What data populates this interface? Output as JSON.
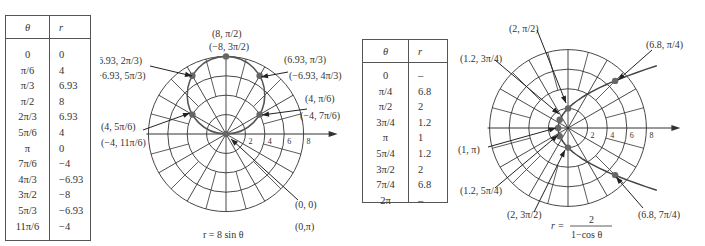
{
  "table1": {
    "headers": [
      "θ",
      "r"
    ],
    "rows": [
      [
        "0",
        "0"
      ],
      [
        "π/6",
        "4"
      ],
      [
        "π/3",
        "6.93"
      ],
      [
        "π/2",
        "8"
      ],
      [
        "2π/3",
        "6.93"
      ],
      [
        "5π/6",
        "4"
      ],
      [
        "π",
        "0"
      ],
      [
        "7π/6",
        "−4"
      ],
      [
        "4π/3",
        "−6.93"
      ],
      [
        "3π/2",
        "−8"
      ],
      [
        "5π/3",
        "−6.93"
      ],
      [
        "11π/6",
        "−4"
      ]
    ]
  },
  "table2": {
    "headers": [
      "θ",
      "r"
    ],
    "rows": [
      [
        "0",
        "–"
      ],
      [
        "π/4",
        "6.8"
      ],
      [
        "π/2",
        "2"
      ],
      [
        "3π/4",
        "1.2"
      ],
      [
        "π",
        "1"
      ],
      [
        "5π/4",
        "1.2"
      ],
      [
        "3π/2",
        "2"
      ],
      [
        "7π/4",
        "6.8"
      ],
      [
        "2π",
        "–"
      ]
    ]
  },
  "plot1": {
    "caption": "r = 8 sin θ",
    "ticks": [
      "2",
      "4",
      "6",
      "8"
    ]
  },
  "plot2": {
    "caption_lhs": "r =",
    "caption_num": "2",
    "caption_den": "1−cos θ",
    "ticks": [
      "2",
      "4",
      "6",
      "8"
    ]
  },
  "chart_data": [
    {
      "type": "scatter",
      "title": "r = 8 sin θ",
      "coordinate_system": "polar",
      "x_label": "θ",
      "y_label": "r",
      "theta": [
        "0",
        "π/6",
        "π/3",
        "π/2",
        "2π/3",
        "5π/6",
        "π",
        "7π/6",
        "4π/3",
        "3π/2",
        "5π/3",
        "11π/6"
      ],
      "r": [
        0,
        4,
        6.93,
        8,
        6.93,
        4,
        0,
        -4,
        -6.93,
        -8,
        -6.93,
        -4
      ],
      "radial_ticks": [
        2,
        4,
        6,
        8
      ],
      "angular_gridlines_deg": [
        0,
        30,
        60,
        90,
        120,
        150,
        180,
        210,
        240,
        270,
        300,
        330
      ],
      "annotations": [
        "(8, π/2) (−8, 3π/2)",
        "(6.93, 2π/3) (−6.93, 5π/3)",
        "(6.93, π/3) (−6.93, 4π/3)",
        "(4, π/6) (−4, 7π/6)",
        "(4, 5π/6) (−4, 11π/6)",
        "(0, 0) (0, π)"
      ]
    },
    {
      "type": "scatter",
      "title": "r = 2/(1−cos θ)",
      "coordinate_system": "polar",
      "x_label": "θ",
      "y_label": "r",
      "theta": [
        "0",
        "π/4",
        "π/2",
        "3π/4",
        "π",
        "5π/4",
        "3π/2",
        "7π/4",
        "2π"
      ],
      "r": [
        null,
        6.8,
        2,
        1.2,
        1,
        1.2,
        2,
        6.8,
        null
      ],
      "radial_ticks": [
        2,
        4,
        6,
        8
      ],
      "angular_gridlines_deg": [
        0,
        30,
        60,
        90,
        120,
        150,
        180,
        210,
        240,
        270,
        300,
        330
      ],
      "annotations": [
        "(2, π/2)",
        "(6.8, π/4)",
        "(1.2, 3π/4)",
        "(1, π)",
        "(1.2, 5π/4)",
        "(2, 3π/2)",
        "(6.8, 7π/4)"
      ]
    }
  ]
}
